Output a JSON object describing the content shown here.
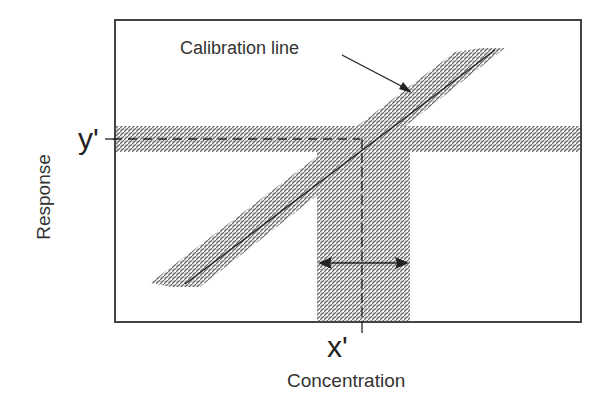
{
  "diagram": {
    "callout_label": "Calibration line",
    "y_marker_label": "y'",
    "x_marker_label": "x'",
    "y_axis_title": "Response",
    "x_axis_title": "Concentration",
    "colors": {
      "frame": "#444444",
      "band_fill": "#9a9a9a",
      "line": "#222222",
      "text": "#333333"
    }
  }
}
